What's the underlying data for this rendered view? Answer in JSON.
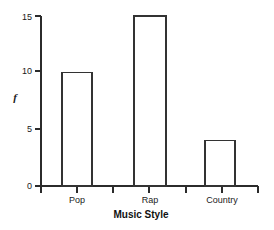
{
  "chart_data": {
    "type": "bar",
    "title": "",
    "categories": [
      "Pop",
      "Rap",
      "Country"
    ],
    "values": [
      10,
      15,
      4
    ],
    "series": [
      {
        "name": "f",
        "values": [
          10,
          15,
          4
        ]
      }
    ],
    "xlabel": "Music Style",
    "ylabel": "f",
    "ylim": [
      0,
      15
    ],
    "yticks": [
      0,
      5,
      10,
      15
    ],
    "ytick_labels": [
      "0",
      "5",
      "10",
      "15"
    ],
    "grid": false,
    "legend": false,
    "bar_fill_color": "#ffffff",
    "bar_edge_color": "#333333",
    "axis_color": "#2b2b2b",
    "background_color": "#ffffff"
  },
  "axes": {
    "y_tick_0": "0",
    "y_tick_1": "5",
    "y_tick_2": "10",
    "y_tick_3": "15",
    "y_axis_label": "f",
    "x_axis_label": "Music Style",
    "cat_0": "Pop",
    "cat_1": "Rap",
    "cat_2": "Country"
  }
}
